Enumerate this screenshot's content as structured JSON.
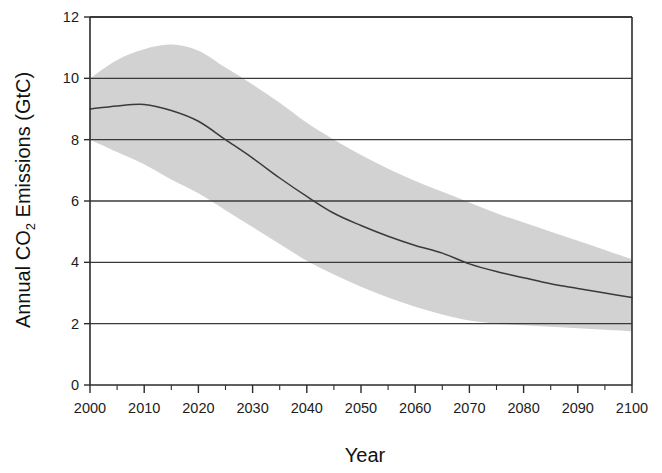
{
  "chart_data": {
    "type": "line",
    "title": "",
    "xlabel": "Year",
    "ylabel_full": "Annual CO2 Emissions (GtC)",
    "ylabel_parts": {
      "before": "Annual CO",
      "subscript": "2",
      "after": " Emissions (GtC)"
    },
    "xlim": [
      2000,
      2100
    ],
    "ylim": [
      0,
      12
    ],
    "grid": "horizontal",
    "legend": "none",
    "x_tick_labels": [
      "2000",
      "2010",
      "2020",
      "2030",
      "2040",
      "2050",
      "2060",
      "2070",
      "2080",
      "2090",
      "2100"
    ],
    "x_tick_values": [
      2000,
      2010,
      2020,
      2030,
      2040,
      2050,
      2060,
      2070,
      2080,
      2090,
      2100
    ],
    "x_minor_tick_values": [
      2005,
      2015,
      2025,
      2035,
      2045,
      2055,
      2065,
      2075,
      2085,
      2095
    ],
    "y_tick_labels": [
      "0",
      "2",
      "4",
      "6",
      "8",
      "10",
      "12"
    ],
    "y_tick_values": [
      0,
      2,
      4,
      6,
      8,
      10,
      12
    ],
    "x": [
      2000,
      2005,
      2010,
      2015,
      2020,
      2025,
      2030,
      2035,
      2040,
      2045,
      2050,
      2055,
      2060,
      2065,
      2070,
      2075,
      2080,
      2085,
      2090,
      2095,
      2100
    ],
    "series": [
      {
        "name": "Central emissions pathway",
        "style": "line",
        "values": [
          9.0,
          9.1,
          9.15,
          8.95,
          8.6,
          8.0,
          7.4,
          6.75,
          6.15,
          5.6,
          5.2,
          4.85,
          4.55,
          4.3,
          3.95,
          3.7,
          3.5,
          3.3,
          3.15,
          3.0,
          2.85
        ]
      },
      {
        "name": "Uncertainty range upper bound",
        "style": "band-upper",
        "values": [
          10.0,
          10.6,
          10.95,
          11.1,
          10.9,
          10.35,
          9.8,
          9.2,
          8.55,
          8.0,
          7.5,
          7.05,
          6.65,
          6.3,
          5.95,
          5.6,
          5.3,
          5.0,
          4.7,
          4.4,
          4.1
        ]
      },
      {
        "name": "Uncertainty range lower bound",
        "style": "band-lower",
        "values": [
          8.0,
          7.6,
          7.2,
          6.7,
          6.25,
          5.7,
          5.15,
          4.6,
          4.05,
          3.6,
          3.2,
          2.85,
          2.55,
          2.3,
          2.1,
          2.0,
          1.95,
          1.9,
          1.85,
          1.8,
          1.75
        ]
      }
    ],
    "colors": {
      "line": "#3a3a3a",
      "band": "#d2d2d2",
      "axis": "#2b2b2b",
      "grid": "#3a3a3a",
      "background": "#ffffff"
    }
  }
}
